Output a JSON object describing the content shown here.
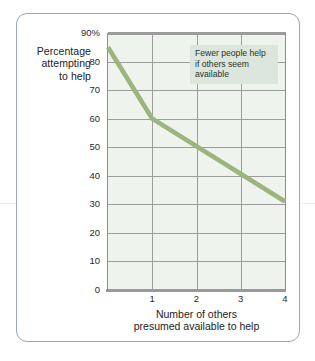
{
  "figure": {
    "card_border_color": "#98a7bd",
    "plot_background": "#eff3ed",
    "gridline_color": "#9d9d9d",
    "axis_color": "#8d8d8d"
  },
  "annotation": {
    "line1": "Fewer people help",
    "line2": "if others seem",
    "line3": "available",
    "background_color": "#dde6dc"
  },
  "y_axis_title": {
    "line1": "Percentage",
    "line2": "attempting",
    "line3": "to help"
  },
  "x_axis_title": {
    "line1": "Number of others",
    "line2": "presumed available to help"
  },
  "chart_data": {
    "type": "line",
    "title": "",
    "xlabel": "Number of others presumed available to help",
    "ylabel": "Percentage attempting to help",
    "x": [
      0,
      1,
      4
    ],
    "values": [
      85,
      60,
      31
    ],
    "series": [
      {
        "name": "Percentage attempting to help",
        "color": "#9cb47d",
        "x": [
          0,
          1,
          4
        ],
        "values": [
          85,
          60,
          31
        ]
      }
    ],
    "xlim": [
      0,
      4
    ],
    "ylim": [
      0,
      90
    ],
    "xticks": [
      1,
      2,
      3,
      4
    ],
    "xtick_labels": [
      "1",
      "2",
      "3",
      "4"
    ],
    "yticks": [
      0,
      10,
      20,
      30,
      40,
      50,
      60,
      70,
      80,
      90
    ],
    "ytick_labels": [
      "0",
      "10",
      "20",
      "30",
      "40",
      "50",
      "60",
      "70",
      "80",
      "90%"
    ],
    "grid": true,
    "legend": "none",
    "annotations": [
      "Fewer people help if others seem available"
    ]
  }
}
